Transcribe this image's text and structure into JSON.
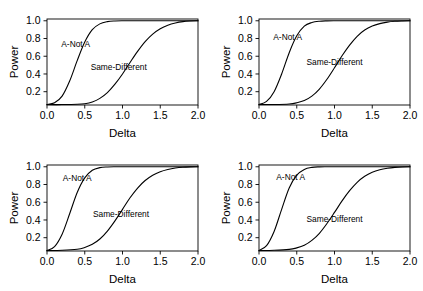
{
  "figure": {
    "layout": "2x2 grid of power curve panels",
    "background_color": "#ffffff",
    "line_color": "#000000"
  },
  "chart_data": [
    {
      "type": "line",
      "panel": "top-left",
      "title": "",
      "xlabel": "Delta",
      "ylabel": "Power",
      "xlim": [
        0.0,
        2.0
      ],
      "ylim": [
        0.05,
        1.02
      ],
      "xticks": [
        "0.0",
        "0.5",
        "1.0",
        "1.5",
        "2.0"
      ],
      "xtick_values": [
        0.0,
        0.5,
        1.0,
        1.5,
        2.0
      ],
      "yticks": [
        "0.2",
        "0.4",
        "0.6",
        "0.8",
        "1.0"
      ],
      "ytick_values": [
        0.2,
        0.4,
        0.6,
        0.8,
        1.0
      ],
      "grid": false,
      "legend": "inline-annotations",
      "annotations": [
        {
          "text": "A-Not A",
          "x": 0.38,
          "y": 0.7
        },
        {
          "text": "Same-Different",
          "x": 0.95,
          "y": 0.44
        }
      ],
      "series": [
        {
          "name": "A-Not A",
          "x": [
            0.0,
            0.1,
            0.2,
            0.3,
            0.4,
            0.5,
            0.6,
            0.7,
            0.8,
            0.9,
            1.0,
            1.2,
            1.4,
            1.6,
            1.8,
            2.0
          ],
          "values": [
            0.055,
            0.075,
            0.15,
            0.32,
            0.55,
            0.76,
            0.9,
            0.965,
            0.99,
            0.998,
            1.0,
            1.0,
            1.0,
            1.0,
            1.0,
            1.0
          ]
        },
        {
          "name": "Same-Different",
          "x": [
            0.0,
            0.2,
            0.4,
            0.5,
            0.6,
            0.7,
            0.8,
            0.9,
            1.0,
            1.1,
            1.2,
            1.3,
            1.4,
            1.5,
            1.6,
            1.7,
            1.8,
            1.9,
            2.0
          ],
          "values": [
            0.055,
            0.055,
            0.058,
            0.065,
            0.085,
            0.125,
            0.19,
            0.285,
            0.4,
            0.53,
            0.655,
            0.765,
            0.85,
            0.91,
            0.95,
            0.975,
            0.99,
            0.997,
            1.0
          ]
        }
      ]
    },
    {
      "type": "line",
      "panel": "top-right",
      "title": "",
      "xlabel": "Delta",
      "ylabel": "Power",
      "xlim": [
        0.0,
        2.0
      ],
      "ylim": [
        0.05,
        1.02
      ],
      "xticks": [
        "0.0",
        "0.5",
        "1.0",
        "1.5",
        "2.0"
      ],
      "xtick_values": [
        0.0,
        0.5,
        1.0,
        1.5,
        2.0
      ],
      "yticks": [
        "0.2",
        "0.4",
        "0.6",
        "0.8",
        "1.0"
      ],
      "ytick_values": [
        0.2,
        0.4,
        0.6,
        0.8,
        1.0
      ],
      "grid": false,
      "legend": "inline-annotations",
      "annotations": [
        {
          "text": "A-Not A",
          "x": 0.38,
          "y": 0.78
        },
        {
          "text": "Same-Different",
          "x": 1.0,
          "y": 0.5
        }
      ],
      "series": [
        {
          "name": "A-Not A",
          "x": [
            0.0,
            0.1,
            0.2,
            0.3,
            0.4,
            0.5,
            0.6,
            0.7,
            0.8,
            0.9,
            1.0,
            1.2,
            1.4,
            1.6,
            1.8,
            2.0
          ],
          "values": [
            0.055,
            0.09,
            0.2,
            0.4,
            0.64,
            0.83,
            0.94,
            0.98,
            0.995,
            0.999,
            1.0,
            1.0,
            1.0,
            1.0,
            1.0,
            1.0
          ]
        },
        {
          "name": "Same-Different",
          "x": [
            0.0,
            0.2,
            0.4,
            0.5,
            0.6,
            0.7,
            0.8,
            0.9,
            1.0,
            1.1,
            1.2,
            1.3,
            1.4,
            1.5,
            1.6,
            1.7,
            1.8,
            1.9,
            2.0
          ],
          "values": [
            0.055,
            0.056,
            0.062,
            0.075,
            0.1,
            0.15,
            0.23,
            0.34,
            0.47,
            0.605,
            0.725,
            0.825,
            0.895,
            0.94,
            0.968,
            0.985,
            0.994,
            0.998,
            1.0
          ]
        }
      ]
    },
    {
      "type": "line",
      "panel": "bottom-left",
      "title": "",
      "xlabel": "Delta",
      "ylabel": "Power",
      "xlim": [
        0.0,
        2.0
      ],
      "ylim": [
        0.05,
        1.02
      ],
      "xticks": [
        "0.0",
        "0.5",
        "1.0",
        "1.5",
        "2.0"
      ],
      "xtick_values": [
        0.0,
        0.5,
        1.0,
        1.5,
        2.0
      ],
      "yticks": [
        "0.2",
        "0.4",
        "0.6",
        "0.8",
        "1.0"
      ],
      "ytick_values": [
        0.2,
        0.4,
        0.6,
        0.8,
        1.0
      ],
      "grid": false,
      "legend": "inline-annotations",
      "annotations": [
        {
          "text": "A-Not A",
          "x": 0.4,
          "y": 0.84
        },
        {
          "text": "Same-Different",
          "x": 0.98,
          "y": 0.43
        }
      ],
      "series": [
        {
          "name": "A-Not A",
          "x": [
            0.0,
            0.1,
            0.2,
            0.3,
            0.4,
            0.5,
            0.6,
            0.7,
            0.8,
            0.9,
            1.0,
            1.2,
            1.4,
            1.6,
            1.8,
            2.0
          ],
          "values": [
            0.055,
            0.1,
            0.24,
            0.47,
            0.71,
            0.875,
            0.96,
            0.99,
            0.998,
            1.0,
            1.0,
            1.0,
            1.0,
            1.0,
            1.0,
            1.0
          ]
        },
        {
          "name": "Same-Different",
          "x": [
            0.0,
            0.2,
            0.4,
            0.5,
            0.6,
            0.7,
            0.8,
            0.9,
            1.0,
            1.1,
            1.2,
            1.3,
            1.4,
            1.5,
            1.6,
            1.7,
            1.8,
            1.9,
            2.0
          ],
          "values": [
            0.055,
            0.058,
            0.07,
            0.09,
            0.125,
            0.185,
            0.275,
            0.39,
            0.52,
            0.65,
            0.76,
            0.845,
            0.905,
            0.945,
            0.97,
            0.986,
            0.995,
            0.999,
            1.0
          ]
        }
      ]
    },
    {
      "type": "line",
      "panel": "bottom-right",
      "title": "",
      "xlabel": "Delta",
      "ylabel": "Power",
      "xlim": [
        0.0,
        2.0
      ],
      "ylim": [
        0.05,
        1.02
      ],
      "xticks": [
        "0.0",
        "0.5",
        "1.0",
        "1.5",
        "2.0"
      ],
      "xtick_values": [
        0.0,
        0.5,
        1.0,
        1.5,
        2.0
      ],
      "yticks": [
        "0.2",
        "0.4",
        "0.6",
        "0.8",
        "1.0"
      ],
      "ytick_values": [
        0.2,
        0.4,
        0.6,
        0.8,
        1.0
      ],
      "grid": false,
      "legend": "inline-annotations",
      "annotations": [
        {
          "text": "A-Not A",
          "x": 0.42,
          "y": 0.85
        },
        {
          "text": "Same-Different",
          "x": 1.0,
          "y": 0.38
        }
      ],
      "series": [
        {
          "name": "A-Not A",
          "x": [
            0.0,
            0.1,
            0.2,
            0.3,
            0.4,
            0.5,
            0.6,
            0.7,
            0.8,
            0.9,
            1.0,
            1.2,
            1.4,
            1.6,
            1.8,
            2.0
          ],
          "values": [
            0.055,
            0.11,
            0.27,
            0.52,
            0.76,
            0.905,
            0.97,
            0.993,
            0.999,
            1.0,
            1.0,
            1.0,
            1.0,
            1.0,
            1.0,
            1.0
          ]
        },
        {
          "name": "Same-Different",
          "x": [
            0.0,
            0.2,
            0.4,
            0.5,
            0.6,
            0.7,
            0.8,
            0.9,
            1.0,
            1.1,
            1.2,
            1.3,
            1.4,
            1.5,
            1.6,
            1.7,
            1.8,
            1.9,
            2.0
          ],
          "values": [
            0.055,
            0.058,
            0.068,
            0.085,
            0.115,
            0.17,
            0.25,
            0.36,
            0.485,
            0.615,
            0.73,
            0.825,
            0.893,
            0.938,
            0.966,
            0.983,
            0.993,
            0.998,
            1.0
          ]
        }
      ]
    }
  ]
}
